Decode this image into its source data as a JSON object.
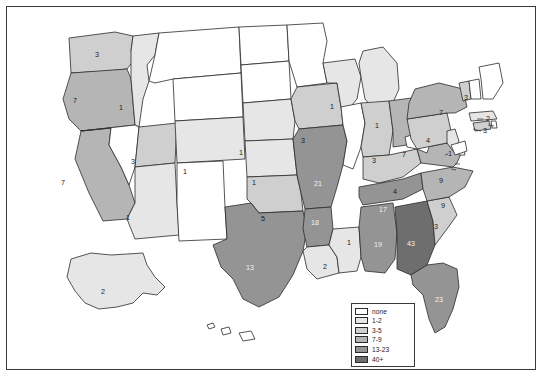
{
  "figure": {
    "type": "choropleth-map",
    "region": "United States",
    "border_color": "#3a3a3a",
    "background": "#ffffff"
  },
  "legend": {
    "name": "map-legend",
    "position": "bottom-center",
    "items": [
      {
        "label": "none",
        "color": "#ffffff"
      },
      {
        "label": "1-2",
        "color": "#e6e6e6"
      },
      {
        "label": "3-5",
        "color": "#cfcfcf"
      },
      {
        "label": "7-9",
        "color": "#b5b5b5"
      },
      {
        "label": "13-23",
        "color": "#949494"
      },
      {
        "label": "40+",
        "color": "#6e6e6e"
      }
    ]
  },
  "chart_data": {
    "type": "choropleth",
    "title": "",
    "bins": [
      {
        "label": "none",
        "min": 0,
        "max": 0,
        "color": "#ffffff"
      },
      {
        "label": "1-2",
        "min": 1,
        "max": 2,
        "color": "#e6e6e6"
      },
      {
        "label": "3-5",
        "min": 3,
        "max": 5,
        "color": "#cfcfcf"
      },
      {
        "label": "7-9",
        "min": 7,
        "max": 9,
        "color": "#b5b5b5"
      },
      {
        "label": "13-23",
        "min": 13,
        "max": 23,
        "color": "#949494"
      },
      {
        "label": "40+",
        "min": 40,
        "max": null,
        "color": "#6e6e6e"
      }
    ],
    "regions": [
      {
        "code": "WA",
        "name": "Washington",
        "value": 3,
        "bin": "3-5",
        "label": "3",
        "lx": 90,
        "ly": 48
      },
      {
        "code": "OR",
        "name": "Oregon",
        "value": 7,
        "bin": "7-9",
        "label": "7",
        "lx": 68,
        "ly": 94
      },
      {
        "code": "CA",
        "name": "California",
        "value": 7,
        "bin": "7-9",
        "label": "7",
        "lx": 56,
        "ly": 176
      },
      {
        "code": "ID",
        "name": "Idaho",
        "value": 1,
        "bin": "1-2",
        "label": "1",
        "lx": 114,
        "ly": 101
      },
      {
        "code": "NV",
        "name": "Nevada",
        "value": 0,
        "bin": "none",
        "label": "",
        "lx": 92,
        "ly": 154
      },
      {
        "code": "UT",
        "name": "Utah",
        "value": 3,
        "bin": "3-5",
        "label": "3",
        "lx": 126,
        "ly": 155
      },
      {
        "code": "AZ",
        "name": "Arizona",
        "value": 1,
        "bin": "1-2",
        "label": "1",
        "lx": 121,
        "ly": 211
      },
      {
        "code": "MT",
        "name": "Montana",
        "value": 0,
        "bin": "none",
        "label": "",
        "lx": 165,
        "ly": 62
      },
      {
        "code": "WY",
        "name": "Wyoming",
        "value": 0,
        "bin": "none",
        "label": "",
        "lx": 163,
        "ly": 113
      },
      {
        "code": "CO",
        "name": "Colorado",
        "value": 1,
        "bin": "1-2",
        "label": "1",
        "lx": 178,
        "ly": 165
      },
      {
        "code": "NM",
        "name": "New Mexico",
        "value": 0,
        "bin": "none",
        "label": "",
        "lx": 170,
        "ly": 221
      },
      {
        "code": "ND",
        "name": "North Dakota",
        "value": 0,
        "bin": "none",
        "label": "",
        "lx": 231,
        "ly": 60
      },
      {
        "code": "SD",
        "name": "South Dakota",
        "value": 0,
        "bin": "none",
        "label": "",
        "lx": 231,
        "ly": 104
      },
      {
        "code": "NE",
        "name": "Nebraska",
        "value": 1,
        "bin": "1-2",
        "label": "1",
        "lx": 234,
        "ly": 146
      },
      {
        "code": "KS",
        "name": "Kansas",
        "value": 1,
        "bin": "1-2",
        "label": "1",
        "lx": 247,
        "ly": 176
      },
      {
        "code": "OK",
        "name": "Oklahoma",
        "value": 5,
        "bin": "3-5",
        "label": "5",
        "lx": 256,
        "ly": 212
      },
      {
        "code": "TX",
        "name": "Texas",
        "value": 13,
        "bin": "13-23",
        "label": "13",
        "lx": 243,
        "ly": 261
      },
      {
        "code": "MN",
        "name": "Minnesota",
        "value": 0,
        "bin": "none",
        "label": "",
        "lx": 281,
        "ly": 66
      },
      {
        "code": "IA",
        "name": "Iowa",
        "value": 3,
        "bin": "3-5",
        "label": "3",
        "lx": 296,
        "ly": 134
      },
      {
        "code": "MO",
        "name": "Missouri",
        "value": 21,
        "bin": "13-23",
        "label": "21",
        "lx": 311,
        "ly": 177
      },
      {
        "code": "AR",
        "name": "Arkansas",
        "value": 18,
        "bin": "13-23",
        "label": "18",
        "lx": 308,
        "ly": 216
      },
      {
        "code": "LA",
        "name": "Louisiana",
        "value": 2,
        "bin": "1-2",
        "label": "2",
        "lx": 318,
        "ly": 260
      },
      {
        "code": "MS",
        "name": "Mississippi",
        "value": 1,
        "bin": "1-2",
        "label": "1",
        "lx": 342,
        "ly": 236
      },
      {
        "code": "WI",
        "name": "Wisconsin",
        "value": 1,
        "bin": "1-2",
        "label": "1",
        "lx": 325,
        "ly": 100
      },
      {
        "code": "IL",
        "name": "Illinois",
        "value": 0,
        "bin": "none",
        "label": "",
        "lx": 337,
        "ly": 152
      },
      {
        "code": "MI",
        "name": "Michigan",
        "value": 1,
        "bin": "1-2",
        "label": "1",
        "lx": 370,
        "ly": 119
      },
      {
        "code": "IN",
        "name": "Indiana",
        "value": 3,
        "bin": "3-5",
        "label": "3",
        "lx": 367,
        "ly": 154
      },
      {
        "code": "OH",
        "name": "Ohio",
        "value": 7,
        "bin": "7-9",
        "label": "7",
        "lx": 397,
        "ly": 148
      },
      {
        "code": "KY",
        "name": "Kentucky",
        "value": 4,
        "bin": "3-5",
        "label": "4",
        "lx": 388,
        "ly": 185
      },
      {
        "code": "TN",
        "name": "Tennessee",
        "value": 17,
        "bin": "13-23",
        "label": "17",
        "lx": 376,
        "ly": 203
      },
      {
        "code": "AL",
        "name": "Alabama",
        "value": 19,
        "bin": "13-23",
        "label": "19",
        "lx": 371,
        "ly": 238
      },
      {
        "code": "GA",
        "name": "Georgia",
        "value": 43,
        "bin": "40+",
        "label": "43",
        "lx": 404,
        "ly": 237
      },
      {
        "code": "FL",
        "name": "Florida",
        "value": 23,
        "bin": "13-23",
        "label": "23",
        "lx": 432,
        "ly": 293
      },
      {
        "code": "SC",
        "name": "South Carolina",
        "value": 3,
        "bin": "3-5",
        "label": "3",
        "lx": 429,
        "ly": 220
      },
      {
        "code": "NC",
        "name": "North Carolina",
        "value": 9,
        "bin": "7-9",
        "label": "9",
        "lx": 436,
        "ly": 199
      },
      {
        "code": "VA",
        "name": "Virginia",
        "value": 9,
        "bin": "7-9",
        "label": "9",
        "lx": 434,
        "ly": 174
      },
      {
        "code": "WV",
        "name": "West Virginia",
        "value": 0,
        "bin": "none",
        "label": "",
        "lx": 410,
        "ly": 168
      },
      {
        "code": "PA",
        "name": "Pennsylvania",
        "value": 4,
        "bin": "3-5",
        "label": "4",
        "lx": 421,
        "ly": 134
      },
      {
        "code": "NY",
        "name": "New York",
        "value": 7,
        "bin": "7-9",
        "label": "7",
        "lx": 434,
        "ly": 106
      },
      {
        "code": "VT",
        "name": "Vermont",
        "value": 3,
        "bin": "3-5",
        "label": "3",
        "lx": 459,
        "ly": 91
      },
      {
        "code": "NH",
        "name": "New Hampshire",
        "value": 0,
        "bin": "none",
        "label": "",
        "lx": 468,
        "ly": 92
      },
      {
        "code": "ME",
        "name": "Maine",
        "value": 0,
        "bin": "none",
        "label": "",
        "lx": 481,
        "ly": 70
      },
      {
        "code": "MA",
        "name": "Massachusetts",
        "value": 2,
        "bin": "1-2",
        "label": "2",
        "lx": 481,
        "ly": 112
      },
      {
        "code": "CT",
        "name": "Connecticut",
        "value": 3,
        "bin": "3-5",
        "label": "3",
        "lx": 478,
        "ly": 124
      },
      {
        "code": "RI",
        "name": "Rhode Island",
        "value": 0,
        "bin": "none",
        "label": "",
        "lx": 487,
        "ly": 119
      },
      {
        "code": "NJ",
        "name": "New Jersey",
        "value": 1,
        "bin": "1-2",
        "label": "1",
        "lx": 443,
        "ly": 147
      },
      {
        "code": "DE",
        "name": "Delaware",
        "value": 0,
        "bin": "none",
        "label": "",
        "lx": 455,
        "ly": 157
      },
      {
        "code": "MD",
        "name": "Maryland",
        "value": 0,
        "bin": "none",
        "label": "",
        "lx": 450,
        "ly": 163
      },
      {
        "code": "AK",
        "name": "Alaska",
        "value": 2,
        "bin": "1-2",
        "label": "2",
        "lx": 96,
        "ly": 285
      },
      {
        "code": "HI",
        "name": "Hawaii",
        "value": 0,
        "bin": "none",
        "label": "",
        "lx": 228,
        "ly": 318
      }
    ]
  }
}
